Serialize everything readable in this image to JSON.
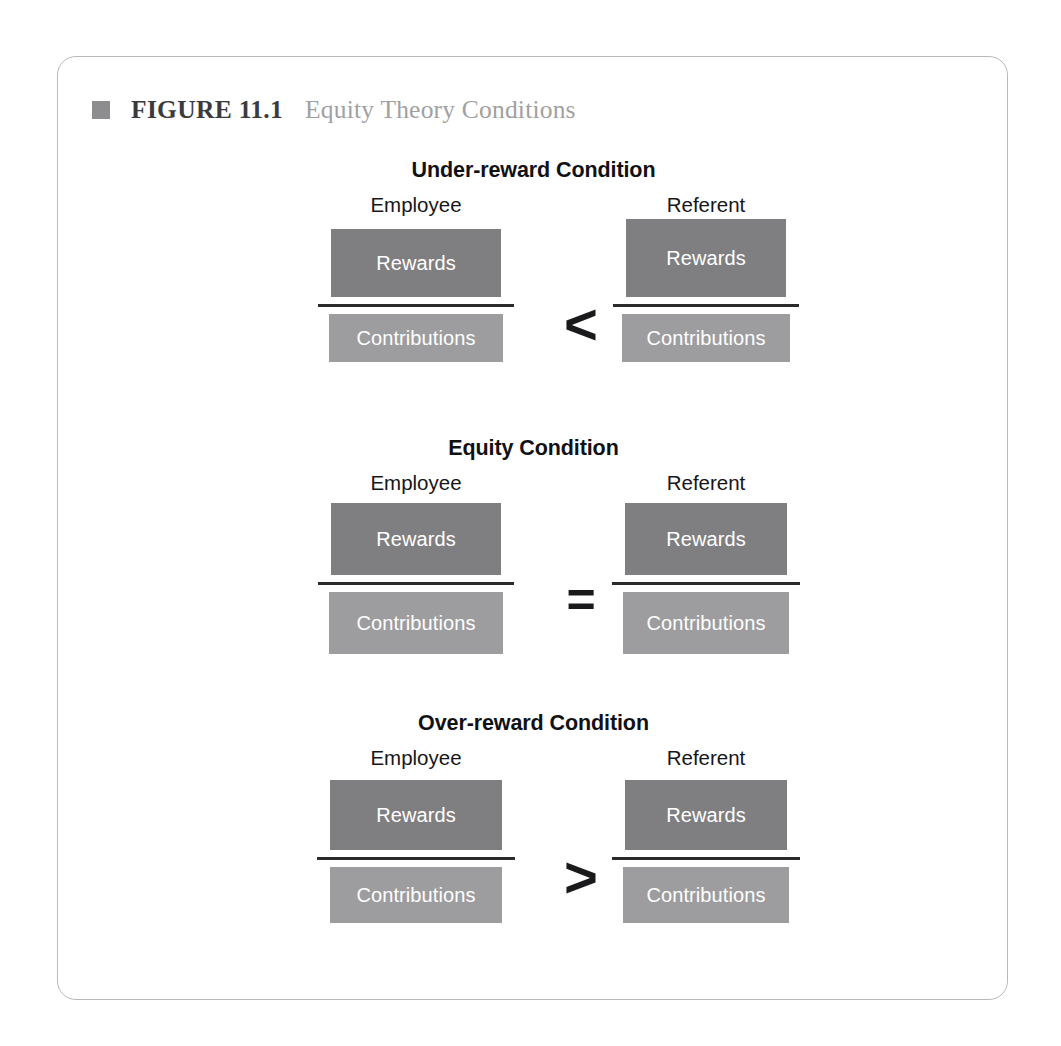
{
  "figure": {
    "bullet_icon": "square-bullet-icon",
    "number_label": "FIGURE 11.1",
    "title": "Equity Theory Conditions"
  },
  "colors": {
    "frame_border": "#b9b9bb",
    "bullet": "#8d8d8f",
    "figure_number_text": "#3b3b3d",
    "figure_title_text": "#a0a0a3",
    "rewards_box": "#7f7f81",
    "contributions_box": "#9d9d9f",
    "box_text": "#ffffff",
    "divider_line": "#2b2b2d",
    "operator_text": "#1a1a1c"
  },
  "labels": {
    "employee": "Employee",
    "referent": "Referent",
    "rewards": "Rewards",
    "contributions": "Contributions"
  },
  "conditions": [
    {
      "title": "Under-reward Condition",
      "operator": "<",
      "operator_name": "less-than",
      "employee": {
        "party": "Employee",
        "rewards": "Rewards",
        "contributions": "Contributions"
      },
      "referent": {
        "party": "Referent",
        "rewards": "Rewards",
        "contributions": "Contributions"
      }
    },
    {
      "title": "Equity Condition",
      "operator": "=",
      "operator_name": "equals",
      "employee": {
        "party": "Employee",
        "rewards": "Rewards",
        "contributions": "Contributions"
      },
      "referent": {
        "party": "Referent",
        "rewards": "Rewards",
        "contributions": "Contributions"
      }
    },
    {
      "title": "Over-reward Condition",
      "operator": ">",
      "operator_name": "greater-than",
      "employee": {
        "party": "Employee",
        "rewards": "Rewards",
        "contributions": "Contributions"
      },
      "referent": {
        "party": "Referent",
        "rewards": "Rewards",
        "contributions": "Contributions"
      }
    }
  ]
}
